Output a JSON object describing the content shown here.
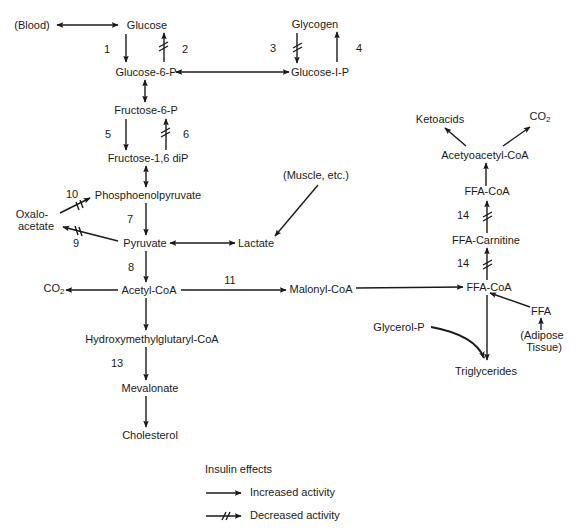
{
  "diagram": {
    "nodes": {
      "blood": "(Blood)",
      "glucose": "Glucose",
      "glycogen": "Glycogen",
      "glucose_6_p": "Glucose-6-P",
      "glucose_1_p": "Glucose-I-P",
      "fructose_6_p": "Fructose-6-P",
      "fructose_16_dip": "Fructose-1,6 diP",
      "phosphoenolpyruvate": "Phosphoenolpyruvate",
      "oxaloacetate_line1": "Oxalo-",
      "oxaloacetate_line2": "acetate",
      "pyruvate": "Pyruvate",
      "lactate": "Lactate",
      "muscle": "(Muscle, etc.)",
      "acetyl_coa": "Acetyl-CoA",
      "co2_left": "CO",
      "co2_left_sub": "2",
      "malonyl_coa": "Malonyl-CoA",
      "hmg_coa": "Hydroxymethylglutaryl-CoA",
      "mevalonate": "Mevalonate",
      "cholesterol": "Cholesterol",
      "ketoacids": "Ketoacids",
      "co2_right": "CO",
      "co2_right_sub": "2",
      "acetoacetyl_coa": "Acetyoacetyl-CoA",
      "ffa_coa_top": "FFA-CoA",
      "ffa_carnitine": "FFA-Carnitine",
      "ffa_coa_bottom": "FFA-CoA",
      "ffa": "FFA",
      "adipose_line1": "(Adipose",
      "adipose_line2": "Tissue)",
      "glycerol_p": "Glycerol-P",
      "triglycerides": "Triglycerides"
    },
    "step_numbers": {
      "n1": "1",
      "n2": "2",
      "n3": "3",
      "n4": "4",
      "n5": "5",
      "n6": "6",
      "n7": "7",
      "n8": "8",
      "n9": "9",
      "n10": "10",
      "n11": "11",
      "n13": "13",
      "n14a": "14",
      "n14b": "14"
    },
    "edges": [
      {
        "from": "Blood",
        "to": "Glucose",
        "type": "bidirectional"
      },
      {
        "from": "Glucose",
        "to": "Glucose-6-P",
        "step": "1",
        "effect": "increased"
      },
      {
        "from": "Glucose-6-P",
        "to": "Glucose",
        "step": "2",
        "effect": "decreased"
      },
      {
        "from": "Glycogen",
        "to": "Glucose-I-P",
        "step": "3",
        "effect": "decreased"
      },
      {
        "from": "Glucose-I-P",
        "to": "Glycogen",
        "step": "4",
        "effect": "increased"
      },
      {
        "from": "Glucose-6-P",
        "to": "Glucose-I-P",
        "type": "bidirectional"
      },
      {
        "from": "Glucose-6-P",
        "to": "Fructose-6-P",
        "type": "bidirectional"
      },
      {
        "from": "Fructose-6-P",
        "to": "Fructose-1,6 diP",
        "step": "5",
        "effect": "increased"
      },
      {
        "from": "Fructose-1,6 diP",
        "to": "Fructose-6-P",
        "step": "6",
        "effect": "decreased"
      },
      {
        "from": "Fructose-1,6 diP",
        "to": "Phosphoenolpyruvate",
        "type": "bidirectional"
      },
      {
        "from": "Oxaloacetate",
        "to": "Phosphoenolpyruvate",
        "step": "10",
        "effect": "decreased"
      },
      {
        "from": "Phosphoenolpyruvate",
        "to": "Pyruvate",
        "step": "7",
        "effect": "increased"
      },
      {
        "from": "Pyruvate",
        "to": "Oxaloacetate",
        "step": "9",
        "effect": "decreased"
      },
      {
        "from": "Pyruvate",
        "to": "Lactate",
        "type": "bidirectional"
      },
      {
        "from": "(Muscle, etc.)",
        "to": "Lactate"
      },
      {
        "from": "Pyruvate",
        "to": "Acetyl-CoA",
        "step": "8",
        "effect": "increased"
      },
      {
        "from": "Acetyl-CoA",
        "to": "CO2"
      },
      {
        "from": "Acetyl-CoA",
        "to": "Malonyl-CoA",
        "step": "11",
        "effect": "increased"
      },
      {
        "from": "Malonyl-CoA",
        "to": "FFA-CoA"
      },
      {
        "from": "Acetyl-CoA",
        "to": "Hydroxymethylglutaryl-CoA"
      },
      {
        "from": "Hydroxymethylglutaryl-CoA",
        "to": "Mevalonate",
        "step": "13",
        "effect": "increased"
      },
      {
        "from": "Mevalonate",
        "to": "Cholesterol"
      },
      {
        "from": "FFA-CoA",
        "to": "FFA-Carnitine",
        "step": "14",
        "effect": "decreased"
      },
      {
        "from": "FFA-Carnitine",
        "to": "FFA-CoA",
        "step": "14",
        "effect": "decreased"
      },
      {
        "from": "FFA-CoA",
        "to": "Acetyoacetyl-CoA"
      },
      {
        "from": "Acetyoacetyl-CoA",
        "to": "Ketoacids"
      },
      {
        "from": "Acetyoacetyl-CoA",
        "to": "CO2"
      },
      {
        "from": "(Adipose Tissue)",
        "to": "FFA"
      },
      {
        "from": "FFA",
        "to": "FFA-CoA"
      },
      {
        "from": "FFA-CoA",
        "to": "Triglycerides"
      },
      {
        "from": "Glycerol-P",
        "to": "Triglycerides"
      }
    ]
  },
  "legend": {
    "title": "Insulin effects",
    "increased": "Increased activity",
    "decreased": "Decreased activity"
  },
  "colors": {
    "ink": "#1a1a1a",
    "background": "#ffffff"
  }
}
